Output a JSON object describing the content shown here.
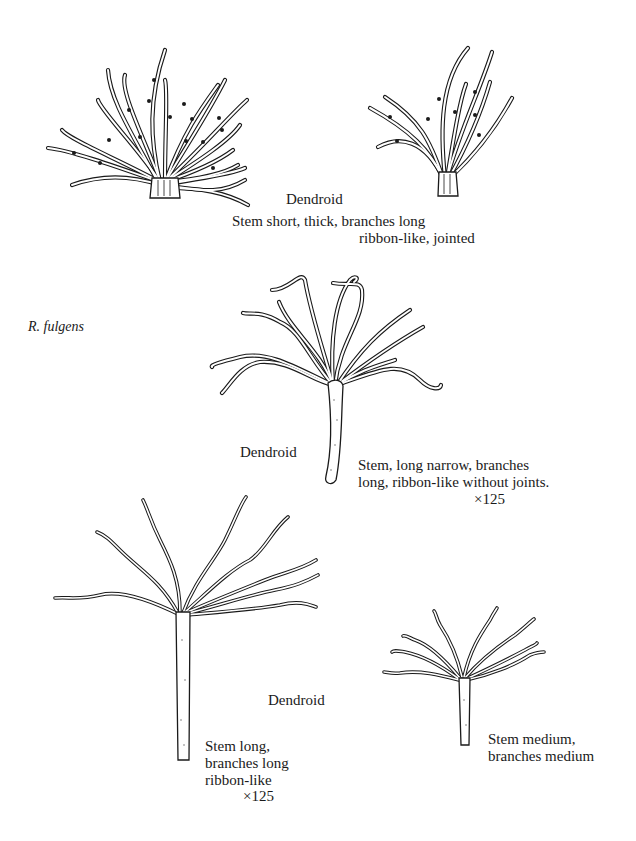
{
  "figure": {
    "species_label": "R. fulgens",
    "specimens": [
      {
        "id": "A",
        "form": "Dendroid",
        "description_lines": [
          "Stem short, thick, branches long",
          "ribbon-like, jointed"
        ]
      },
      {
        "id": "B",
        "form": "Dendroid",
        "description_lines": [
          "Stem, long narrow, branches",
          "long, ribbon-like without joints."
        ],
        "magnification": "×125"
      },
      {
        "id": "C",
        "form": "Dendroid",
        "description_lines": [
          "Stem long,",
          "branches long",
          "ribbon-like"
        ],
        "magnification": "×125"
      },
      {
        "id": "D",
        "description_lines": [
          "Stem medium,",
          "branches medium"
        ]
      }
    ]
  }
}
